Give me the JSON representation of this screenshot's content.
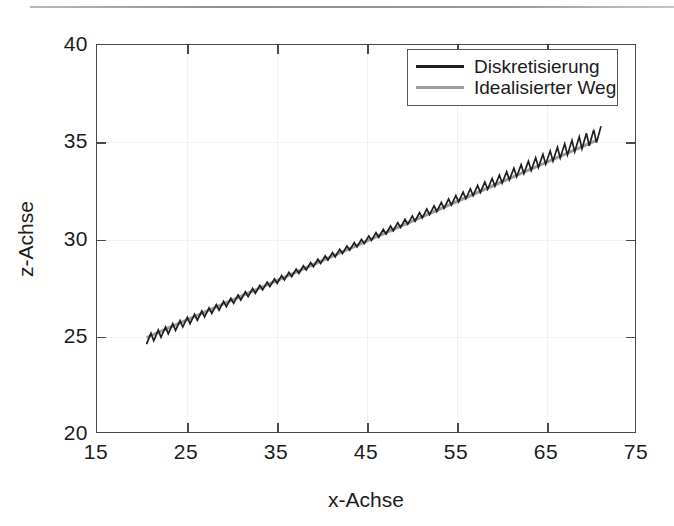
{
  "figure": {
    "top_rule": "scan-artifact-line"
  },
  "chart_data": {
    "type": "line",
    "title": "",
    "xlabel": "x-Achse",
    "ylabel": "z-Achse",
    "xlim": [
      15,
      75
    ],
    "ylim": [
      20,
      40
    ],
    "xticks": [
      15,
      25,
      35,
      45,
      55,
      65,
      75
    ],
    "yticks": [
      20,
      25,
      30,
      35,
      40
    ],
    "xtick_labels": [
      "15",
      "25",
      "35",
      "45",
      "55",
      "65",
      "75"
    ],
    "ytick_labels": [
      "20",
      "25",
      "30",
      "35",
      "40"
    ],
    "grid": true,
    "legend_position": "upper right",
    "series": [
      {
        "name": "Diskretisierung",
        "color": "#1f1f1f",
        "style": "sawtooth",
        "description": "Zigzag discretised path oscillating about the ideal line",
        "x_range": [
          20.5,
          70.5
        ],
        "y_range": [
          24.9,
          35.4
        ],
        "teeth": 62,
        "amplitude_start": 0.28,
        "amplitude_mid": 0.05,
        "amplitude_end": 0.42
      },
      {
        "name": "Idealisierter Weg",
        "color": "#9d9d9d",
        "style": "straight",
        "description": "Idealised straight path",
        "points": [
          [
            20.5,
            24.95
          ],
          [
            70.5,
            35.1
          ]
        ]
      }
    ],
    "legend": [
      {
        "label": "Diskretisierung",
        "color": "#1f1f1f"
      },
      {
        "label": "Idealisierter Weg",
        "color": "#9d9d9d"
      }
    ]
  },
  "colors": {
    "axis": "#4a4a4a",
    "grid": "#f1f1f1",
    "text": "#1c1c1c",
    "series_dark": "#1f1f1f",
    "series_light": "#9d9d9d",
    "background": "#ffffff"
  }
}
